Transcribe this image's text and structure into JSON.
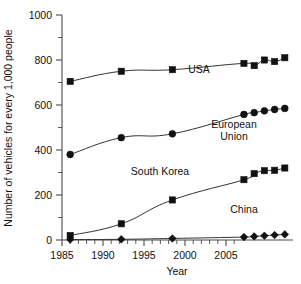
{
  "chart_data": {
    "type": "line",
    "title": "",
    "xlabel": "Year",
    "ylabel": "Number of vehicles for every 1,000 people",
    "xlim": [
      1984.2,
      2006.8
    ],
    "ylim": [
      0,
      1000
    ],
    "grid": false,
    "legend_position": "inline-annotations",
    "x_ticks": [
      1985,
      1990,
      1995,
      2000,
      2005
    ],
    "x_tick_labels": [
      "1985",
      "1990",
      "1995",
      "2000",
      "2005"
    ],
    "x_minor_tick_step": 1,
    "y_ticks": [
      0,
      200,
      400,
      600,
      800,
      1000
    ],
    "y_tick_labels": [
      "0",
      "200",
      "400",
      "600",
      "800",
      "1000"
    ],
    "y_minor_ticks": [
      100,
      300,
      500,
      700,
      900
    ],
    "series": [
      {
        "name": "USA",
        "marker": "square",
        "label": "USA",
        "label_x": 1996.8,
        "label_y": 700,
        "x": [
          1985,
          1990,
          1995,
          2002,
          2003,
          2004,
          2005,
          2006
        ],
        "values": [
          705,
          750,
          757,
          785,
          775,
          800,
          793,
          810
        ]
      },
      {
        "name": "European Union",
        "marker": "circle",
        "label": "European Union",
        "label_line1": "European",
        "label_line2": "Union",
        "label_x": 2001.3,
        "label_y": 480,
        "x": [
          1985,
          1990,
          1995,
          2002,
          2003,
          2004,
          2005,
          2006
        ],
        "values": [
          380,
          455,
          472,
          558,
          566,
          574,
          580,
          585
        ]
      },
      {
        "name": "South Korea",
        "marker": "square",
        "label": "South Korea",
        "label_x": 1996.0,
        "label_y": 285,
        "x": [
          1985,
          1990,
          1995,
          2002,
          2003,
          2004,
          2005,
          2006
        ],
        "values": [
          20,
          72,
          178,
          268,
          295,
          308,
          310,
          320
        ]
      },
      {
        "name": "China",
        "marker": "diamond",
        "label": "China",
        "label_x": 2003.8,
        "label_y": 92,
        "x": [
          1985,
          1990,
          1995,
          2002,
          2003,
          2004,
          2005,
          2006
        ],
        "values": [
          2,
          3,
          7,
          13,
          16,
          19,
          22,
          25
        ]
      }
    ]
  },
  "figure": {
    "accent_color": "#111111",
    "background_color": "#ffffff",
    "axis_color": "#4a4a4a"
  }
}
